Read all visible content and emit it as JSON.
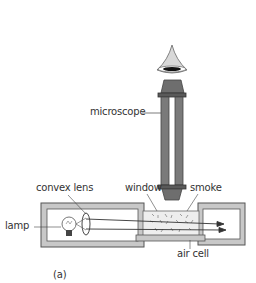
{
  "diagram": {
    "caption": "(a)",
    "labels": {
      "microscope": "microscope",
      "convex_lens": "convex lens",
      "window": "window",
      "smoke": "smoke",
      "lamp": "lamp",
      "air_cell": "air cell"
    },
    "colors": {
      "box_fill": "#c8c8c8",
      "box_stroke": "#555555",
      "microscope_fill": "#6e6e6e",
      "cell_fill": "#eaeaea",
      "line": "#333333"
    }
  }
}
